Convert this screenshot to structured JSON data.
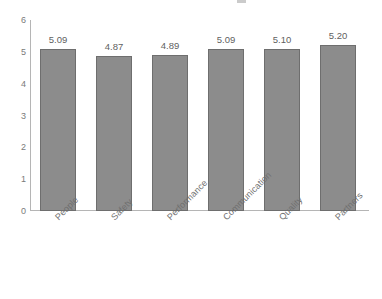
{
  "chart_data": {
    "type": "bar",
    "title": "",
    "subtitle": "",
    "xlabel": "",
    "ylabel": "",
    "categories": [
      "People",
      "Safety",
      "Performance",
      "Communication",
      "Quality",
      "Partners"
    ],
    "values": [
      5.09,
      4.87,
      4.89,
      5.09,
      5.1,
      5.2
    ],
    "value_labels": [
      "5.09",
      "4.87",
      "4.89",
      "5.09",
      "5.10",
      "5.20"
    ],
    "series": [
      {
        "name": "Score",
        "values": [
          5.09,
          4.87,
          4.89,
          5.09,
          5.1,
          5.2
        ]
      }
    ],
    "ylim": [
      0,
      6
    ],
    "y_ticks": [
      0,
      1,
      2,
      3,
      4,
      5,
      6
    ],
    "y_tick_labels": [
      "0",
      "1",
      "2",
      "3",
      "4",
      "5",
      "6"
    ],
    "grid": false,
    "legend": "none",
    "bar_color": "#8c8c8c",
    "bar_border_color": "#6e6e6e",
    "axis_color": "#b5b5b5",
    "text_color": "#6f6f6f",
    "background": "#ffffff",
    "category_label_rotation": -45
  }
}
